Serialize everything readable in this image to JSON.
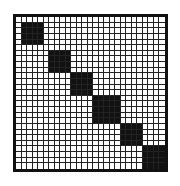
{
  "matrix": {
    "size": 27,
    "line_color": "#222222",
    "fill_color": "#111111",
    "background": "#ffffff",
    "blocks": [
      {
        "start": 1,
        "end": 4
      },
      {
        "start": 6,
        "end": 9
      },
      {
        "start": 10,
        "end": 13
      },
      {
        "start": 14,
        "end": 18
      },
      {
        "start": 19,
        "end": 22
      },
      {
        "start": 23,
        "end": 26
      }
    ]
  }
}
